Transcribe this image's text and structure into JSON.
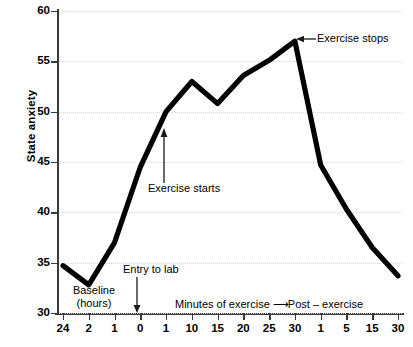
{
  "chart_data": {
    "type": "line",
    "title": "",
    "xlabel": "",
    "ylabel": "State anxiety",
    "ylim": [
      30,
      60
    ],
    "yticks": [
      60,
      55,
      50,
      45,
      40,
      35,
      30
    ],
    "categories": [
      "24",
      "2",
      "1",
      "0",
      "1",
      "10",
      "15",
      "20",
      "25",
      "30",
      "1",
      "5",
      "15",
      "30"
    ],
    "values": [
      34.7,
      32.8,
      37.0,
      44.5,
      50.0,
      53.0,
      50.8,
      53.6,
      55.1,
      57.0,
      44.7,
      40.3,
      36.5,
      33.7
    ],
    "grid": true,
    "legend": "none",
    "series": [
      {
        "name": "State anxiety",
        "values": [
          34.7,
          32.8,
          37.0,
          44.5,
          50.0,
          53.0,
          50.8,
          53.6,
          55.1,
          57.0,
          44.7,
          40.3,
          36.5,
          33.7
        ]
      }
    ],
    "annotations": [
      {
        "text": "Baseline (hours)",
        "at_category": "2",
        "kind": "bracket-label"
      },
      {
        "text": "Entry to lab",
        "at_category": "0",
        "kind": "down-arrow"
      },
      {
        "text": "Exercise starts",
        "at_category": "1",
        "kind": "up-arrow"
      },
      {
        "text": "Exercise stops",
        "at_category": "30",
        "kind": "left-arrow"
      },
      {
        "text": "Minutes of exercise → Post – exercise",
        "kind": "axis-span-label"
      }
    ],
    "line_color": "#000000",
    "grid_color": "#d8d8d8",
    "axis_color": "#3a3a3a"
  },
  "axis": {
    "y_title": "State anxiety",
    "y_labels": [
      "60",
      "55",
      "50",
      "45",
      "40",
      "35",
      "30"
    ],
    "x_labels": [
      "24",
      "2",
      "1",
      "0",
      "1",
      "10",
      "15",
      "20",
      "25",
      "30",
      "1",
      "5",
      "15",
      "30"
    ]
  },
  "annotations": {
    "baseline_line1": "Baseline",
    "baseline_line2": "(hours)",
    "entry_to_lab": "Entry to lab",
    "exercise_starts": "Exercise starts",
    "exercise_stops": "Exercise stops",
    "minutes_prefix": "Minutes of exercise ",
    "minutes_arrow": "⟶",
    "minutes_suffix": "Post – exercise"
  }
}
